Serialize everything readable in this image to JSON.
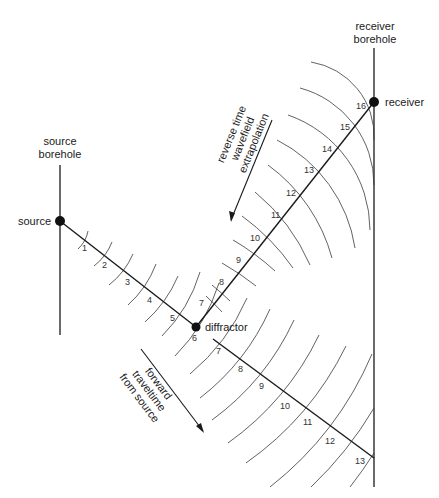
{
  "labels": {
    "source_borehole_line1": "source",
    "source_borehole_line2": "borehole",
    "receiver_borehole_line1": "receiver",
    "receiver_borehole_line2": "borehole",
    "source": "source",
    "receiver": "receiver",
    "diffractor": "diffractor",
    "reverse_line1": "reverse  time",
    "reverse_line2": "wavefield",
    "reverse_line3": "extrapolation",
    "forward_line1": "forward",
    "forward_line2": "traveltime",
    "forward_line3": "from  source"
  },
  "source_path_ticks": [
    "1",
    "2",
    "3",
    "4",
    "5",
    "6"
  ],
  "forward_path_ticks": [
    "7",
    "8",
    "9",
    "10",
    "11",
    "12",
    "13"
  ],
  "reverse_path_ticks": [
    "7",
    "8",
    "9",
    "10",
    "11",
    "12",
    "13",
    "14",
    "15",
    "16"
  ],
  "colors": {
    "ink": "#1a1a1a",
    "background": "#ffffff"
  }
}
